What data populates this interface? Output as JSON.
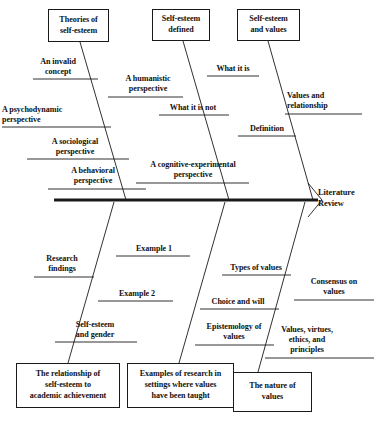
{
  "diagram": {
    "type": "fishbone-ishikawa",
    "effect": {
      "label": "Literature\nReview",
      "x": 318,
      "y": 188
    },
    "spine": {
      "x1": 54,
      "y1": 200,
      "x2": 318,
      "y2": 200
    },
    "categories": [
      {
        "id": "theories-of-self-esteem",
        "label": "Theories of\nself-esteem",
        "position": "top",
        "box": {
          "x": 48,
          "y": 9,
          "w": 61,
          "h": 33
        },
        "bone": {
          "x1": 80,
          "y1": 42,
          "x2": 126,
          "y2": 200
        },
        "causes": [
          {
            "label": "An invalid\nconcept",
            "side": "left",
            "line": {
              "x1": 33,
              "y1": 79,
              "x2": 98,
              "y2": 79
            },
            "text": {
              "x": 21,
              "y": 57,
              "w": 74,
              "align": "center"
            }
          },
          {
            "label": "A humanistic\nperspective",
            "side": "right",
            "line": {
              "x1": 108,
              "y1": 97,
              "x2": 183,
              "y2": 97
            },
            "text": {
              "x": 110,
              "y": 74,
              "w": 76,
              "align": "center"
            }
          },
          {
            "label": "A psychodynamic\nperspective",
            "side": "left",
            "line": {
              "x1": 2,
              "y1": 127,
              "x2": 111,
              "y2": 127
            },
            "text": {
              "x": 2,
              "y": 105,
              "w": 103,
              "align": "left"
            }
          },
          {
            "label": "A sociological\nperspective",
            "side": "left",
            "line": {
              "x1": 27,
              "y1": 159,
              "x2": 129,
              "y2": 159
            },
            "text": {
              "x": 28,
              "y": 137,
              "w": 94,
              "align": "center"
            }
          },
          {
            "label": "A behavioral\nperspective",
            "side": "left",
            "line": {
              "x1": 48,
              "y1": 189,
              "x2": 146,
              "y2": 189
            },
            "text": {
              "x": 46,
              "y": 166,
              "w": 94,
              "align": "center"
            }
          },
          {
            "label": "A cognitive-experimental\nperspective",
            "side": "right",
            "line": {
              "x1": 136,
              "y1": 183,
              "x2": 249,
              "y2": 183
            },
            "text": {
              "x": 134,
              "y": 160,
              "w": 118,
              "align": "center"
            }
          }
        ]
      },
      {
        "id": "self-esteem-defined",
        "label": "Self-esteem\ndefined",
        "position": "top",
        "box": {
          "x": 152,
          "y": 9,
          "w": 58,
          "h": 32
        },
        "bone": {
          "x1": 183,
          "y1": 41,
          "x2": 229,
          "y2": 200
        },
        "causes": [
          {
            "label": "What it is",
            "side": "right",
            "line": {
              "x1": 207,
              "y1": 76,
              "x2": 259,
              "y2": 76
            },
            "text": {
              "x": 204,
              "y": 64,
              "w": 58,
              "align": "center"
            }
          },
          {
            "label": "What it is not",
            "side": "left",
            "line": {
              "x1": 159,
              "y1": 115,
              "x2": 229,
              "y2": 115
            },
            "text": {
              "x": 157,
              "y": 103,
              "w": 72,
              "align": "center"
            }
          },
          {
            "label": "Definition",
            "side": "right",
            "line": {
              "x1": 238,
              "y1": 136,
              "x2": 296,
              "y2": 136
            },
            "text": {
              "x": 239,
              "y": 124,
              "w": 56,
              "align": "center"
            }
          }
        ]
      },
      {
        "id": "self-esteem-and-values",
        "label": "Self-esteem\nand values",
        "position": "top",
        "box": {
          "x": 237,
          "y": 9,
          "w": 63,
          "h": 32
        },
        "bone": {
          "x1": 268,
          "y1": 41,
          "x2": 313,
          "y2": 200
        },
        "causes": [
          {
            "label": "Values and\nrelationship",
            "side": "right",
            "line": {
              "x1": 285,
              "y1": 114,
              "x2": 362,
              "y2": 114
            },
            "text": {
              "x": 287,
              "y": 91,
              "w": 72,
              "align": "left"
            }
          }
        ]
      },
      {
        "id": "relationship-self-esteem-academic",
        "label": "The relationship of\nself-esteem to\nacademic achievement",
        "position": "bottom",
        "box": {
          "x": 16,
          "y": 363,
          "w": 104,
          "h": 45
        },
        "bone": {
          "x1": 68,
          "y1": 363,
          "x2": 114,
          "y2": 202
        },
        "causes": [
          {
            "label": "Research\nfindings",
            "side": "left",
            "line": {
              "x1": 34,
              "y1": 277,
              "x2": 94,
              "y2": 277
            },
            "text": {
              "x": 31,
              "y": 254,
              "w": 62,
              "align": "center"
            }
          },
          {
            "label": "Self-esteem\nand gender",
            "side": "left",
            "line": {
              "x1": 55,
              "y1": 342,
              "x2": 137,
              "y2": 342
            },
            "text": {
              "x": 59,
              "y": 320,
              "w": 72,
              "align": "center"
            }
          }
        ]
      },
      {
        "id": "examples-of-research-values",
        "label": "Examples of research in\nsettings where values\nhave been taught",
        "position": "bottom",
        "box": {
          "x": 127,
          "y": 363,
          "w": 107,
          "h": 45
        },
        "bone": {
          "x1": 179,
          "y1": 363,
          "x2": 225,
          "y2": 202
        },
        "causes": [
          {
            "label": "Example 1",
            "side": "right",
            "line": {
              "x1": 116,
              "y1": 256,
              "x2": 190,
              "y2": 256
            },
            "text": {
              "x": 123,
              "y": 244,
              "w": 62,
              "align": "center"
            }
          },
          {
            "label": "Example 2",
            "side": "right",
            "line": {
              "x1": 98,
              "y1": 301,
              "x2": 173,
              "y2": 301
            },
            "text": {
              "x": 106,
              "y": 289,
              "w": 62,
              "align": "center"
            }
          }
        ]
      },
      {
        "id": "the-nature-of-values",
        "label": "The nature of\nvalues",
        "position": "bottom",
        "box": {
          "x": 233,
          "y": 372,
          "w": 79,
          "h": 40
        },
        "bone": {
          "x1": 258,
          "y1": 372,
          "x2": 305,
          "y2": 202
        },
        "causes": [
          {
            "label": "Types of values",
            "side": "left",
            "line": {
              "x1": 222,
              "y1": 275,
              "x2": 291,
              "y2": 275
            },
            "text": {
              "x": 220,
              "y": 263,
              "w": 72,
              "align": "center"
            }
          },
          {
            "label": "Consensus on\nvalues",
            "side": "right",
            "line": {
              "x1": 294,
              "y1": 300,
              "x2": 374,
              "y2": 300
            },
            "text": {
              "x": 296,
              "y": 277,
              "w": 76,
              "align": "center"
            }
          },
          {
            "label": "Choice and will",
            "side": "left",
            "line": {
              "x1": 200,
              "y1": 309,
              "x2": 279,
              "y2": 309
            },
            "text": {
              "x": 201,
              "y": 297,
              "w": 74,
              "align": "center"
            }
          },
          {
            "label": "Epistemology of\nvalues",
            "side": "left",
            "line": {
              "x1": 195,
              "y1": 345,
              "x2": 274,
              "y2": 345
            },
            "text": {
              "x": 194,
              "y": 322,
              "w": 80,
              "align": "center"
            }
          },
          {
            "label": "Values, virtues,\nethics, and\nprinciples",
            "side": "right",
            "line": {
              "x1": 265,
              "y1": 358,
              "x2": 374,
              "y2": 358
            },
            "text": {
              "x": 266,
              "y": 325,
              "w": 82,
              "align": "center"
            }
          }
        ]
      }
    ],
    "colors": {
      "line": "#1a1a1a",
      "spine": "#111111",
      "text": "#111111",
      "background": "#ffffff"
    }
  }
}
